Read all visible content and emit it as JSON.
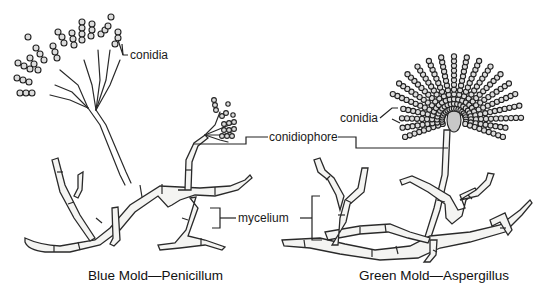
{
  "figure": {
    "left_panel": {
      "caption": "Blue Mold—Penicillum",
      "labels": {
        "conidia": "conidia"
      }
    },
    "right_panel": {
      "caption": "Green Mold—Aspergillus",
      "labels": {
        "conidia": "conidia"
      }
    },
    "shared_labels": {
      "conidiophore": "conidiophore",
      "mycelium": "mycelium"
    }
  }
}
